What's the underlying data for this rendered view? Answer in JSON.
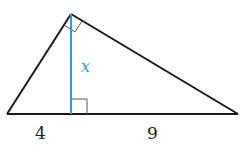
{
  "diagram": {
    "type": "right-triangle-altitude",
    "colors": {
      "stroke": "#1a1a1a",
      "altitude": "#2a9fd6",
      "background": "#ffffff"
    },
    "labels": {
      "altitude": "x",
      "left_segment": "4",
      "right_segment": "9"
    },
    "right_angle_markers": [
      "apex",
      "altitude-foot"
    ]
  }
}
